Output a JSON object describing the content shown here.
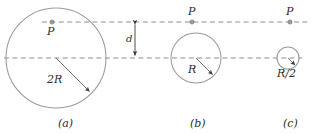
{
  "figure": {
    "background_color": "#ffffff",
    "stroke_color_circle": "#9a9a9a",
    "stroke_color_dashed": "#8f8f8f",
    "stroke_color_arrow": "#3a3a3a",
    "text_color": "#2b2b2b",
    "width": 314,
    "height": 134
  },
  "axes": {
    "upper_line": {
      "y": 22,
      "x_start": 42,
      "x_end": 309,
      "style": "dashed"
    },
    "lower_line": {
      "y": 58,
      "x_start": 4,
      "x_end": 302,
      "style": "dashed"
    },
    "separation": {
      "label": "d",
      "label_x": 126,
      "label_y": 34,
      "arrow_x": 135,
      "arrow_y_top": 22,
      "arrow_y_bottom": 58
    }
  },
  "panels": [
    {
      "id": "a",
      "caption": "(a)",
      "caption_x": 58,
      "caption_y": 120,
      "circle": {
        "cx": 56,
        "cy": 58,
        "r": 50
      },
      "radius_label": "2R",
      "radius_label_x": 47,
      "radius_label_y": 80,
      "radius_arrow": {
        "x1": 56,
        "y1": 58,
        "x2": 91,
        "y2": 93
      },
      "point": {
        "label": "P",
        "cx": 52,
        "cy": 22,
        "label_x": 47,
        "label_y": 26,
        "label_position": "below"
      }
    },
    {
      "id": "b",
      "caption": "(b)",
      "caption_x": 190,
      "caption_y": 120,
      "circle": {
        "cx": 196,
        "cy": 58,
        "r": 25
      },
      "radius_label": "R",
      "radius_label_x": 190,
      "radius_label_y": 69,
      "radius_arrow": {
        "x1": 196,
        "y1": 58,
        "x2": 214,
        "y2": 76
      },
      "point": {
        "label": "P",
        "cx": 192,
        "cy": 22,
        "label_x": 188,
        "label_y": 6,
        "label_position": "above"
      }
    },
    {
      "id": "c",
      "caption": "(c)",
      "caption_x": 283,
      "caption_y": 120,
      "circle": {
        "cx": 288,
        "cy": 58,
        "r": 11
      },
      "radius_label": "R/2",
      "radius_label_x": 278,
      "radius_label_y": 71,
      "radius_arrow": {
        "x1": 288,
        "y1": 58,
        "x2": 296,
        "y2": 66
      },
      "point": {
        "label": "P",
        "cx": 290,
        "cy": 22,
        "label_x": 286,
        "label_y": 6,
        "label_position": "above"
      }
    }
  ]
}
